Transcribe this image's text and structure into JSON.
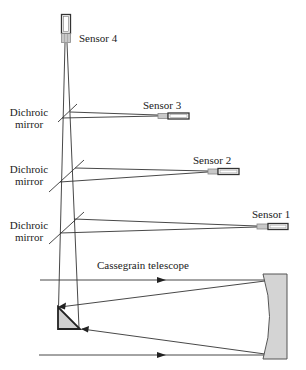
{
  "diagram": {
    "type": "optical-schematic",
    "colors": {
      "line": "#333333",
      "fill_gray": "#cfcfcf",
      "sensor_light": "#bdbdbd",
      "sensor_dark": "#444444",
      "background": "#ffffff"
    },
    "sensors": [
      {
        "id": "sensor-4",
        "label": "Sensor 4"
      },
      {
        "id": "sensor-3",
        "label": "Sensor 3"
      },
      {
        "id": "sensor-2",
        "label": "Sensor 2"
      },
      {
        "id": "sensor-1",
        "label": "Sensor 1"
      }
    ],
    "mirrors": [
      {
        "id": "dichroic-mirror-1",
        "label_line1": "Dichroic",
        "label_line2": "mirror"
      },
      {
        "id": "dichroic-mirror-2",
        "label_line1": "Dichroic",
        "label_line2": "mirror"
      },
      {
        "id": "dichroic-mirror-3",
        "label_line1": "Dichroic",
        "label_line2": "mirror"
      }
    ],
    "telescope": {
      "label": "Cassegrain telescope"
    }
  }
}
